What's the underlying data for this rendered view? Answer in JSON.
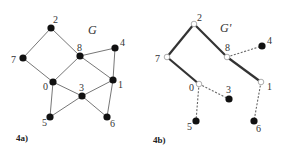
{
  "figure": {
    "panels": [
      {
        "id": "4a",
        "panel_label": "4a)",
        "graph_title": "G",
        "title_pos": [
          88,
          34
        ],
        "label_pos": [
          16,
          141
        ],
        "nodes": [
          {
            "id": "0",
            "x": 53,
            "y": 82,
            "style": "filled",
            "lx": -10,
            "ly": 8
          },
          {
            "id": "1",
            "x": 113,
            "y": 80,
            "style": "filled",
            "lx": 5,
            "ly": 8
          },
          {
            "id": "2",
            "x": 51,
            "y": 28,
            "style": "filled",
            "lx": 2,
            "ly": -5
          },
          {
            "id": "3",
            "x": 82,
            "y": 96,
            "style": "filled",
            "lx": -3,
            "ly": -5
          },
          {
            "id": "4",
            "x": 115,
            "y": 48,
            "style": "filled",
            "lx": 5,
            "ly": -2
          },
          {
            "id": "5",
            "x": 50,
            "y": 117,
            "style": "filled",
            "lx": -8,
            "ly": 9
          },
          {
            "id": "6",
            "x": 107,
            "y": 117,
            "style": "filled",
            "lx": 3,
            "ly": 10
          },
          {
            "id": "7",
            "x": 23,
            "y": 58,
            "style": "filled",
            "lx": -12,
            "ly": 5
          },
          {
            "id": "8",
            "x": 80,
            "y": 56,
            "style": "filled",
            "lx": -3,
            "ly": -5
          }
        ],
        "edges": [
          {
            "from": "2",
            "to": "7",
            "style": "thin"
          },
          {
            "from": "2",
            "to": "8",
            "style": "thin"
          },
          {
            "from": "7",
            "to": "0",
            "style": "thin"
          },
          {
            "from": "8",
            "to": "0",
            "style": "thin"
          },
          {
            "from": "8",
            "to": "4",
            "style": "thin"
          },
          {
            "from": "8",
            "to": "1",
            "style": "thin"
          },
          {
            "from": "4",
            "to": "1",
            "style": "thin"
          },
          {
            "from": "0",
            "to": "3",
            "style": "thin"
          },
          {
            "from": "0",
            "to": "5",
            "style": "thin"
          },
          {
            "from": "3",
            "to": "1",
            "style": "thin"
          },
          {
            "from": "3",
            "to": "5",
            "style": "thin"
          },
          {
            "from": "3",
            "to": "6",
            "style": "thin"
          },
          {
            "from": "1",
            "to": "6",
            "style": "thin"
          }
        ]
      },
      {
        "id": "4b",
        "panel_label": "4b)",
        "graph_title": "G'",
        "title_pos": [
          220,
          32
        ],
        "label_pos": [
          153,
          143
        ],
        "nodes": [
          {
            "id": "0",
            "x": 199,
            "y": 84,
            "style": "open",
            "lx": -10,
            "ly": 7
          },
          {
            "id": "1",
            "x": 261,
            "y": 82,
            "style": "open",
            "lx": 6,
            "ly": 8
          },
          {
            "id": "2",
            "x": 194,
            "y": 24,
            "style": "open",
            "lx": 3,
            "ly": -3
          },
          {
            "id": "3",
            "x": 229,
            "y": 99,
            "style": "filled",
            "lx": -3,
            "ly": -6
          },
          {
            "id": "4",
            "x": 262,
            "y": 46,
            "style": "filled",
            "lx": 5,
            "ly": -2
          },
          {
            "id": "5",
            "x": 196,
            "y": 121,
            "style": "filled",
            "lx": -9,
            "ly": 9
          },
          {
            "id": "6",
            "x": 254,
            "y": 121,
            "style": "filled",
            "lx": 2,
            "ly": 11
          },
          {
            "id": "7",
            "x": 167,
            "y": 57,
            "style": "open",
            "lx": -12,
            "ly": 5
          },
          {
            "id": "8",
            "x": 227,
            "y": 57,
            "style": "open",
            "lx": -2,
            "ly": -6
          }
        ],
        "edges": [
          {
            "from": "2",
            "to": "7",
            "style": "bold"
          },
          {
            "from": "2",
            "to": "8",
            "style": "bold"
          },
          {
            "from": "7",
            "to": "0",
            "style": "bold"
          },
          {
            "from": "8",
            "to": "1",
            "style": "bold"
          },
          {
            "from": "8",
            "to": "4",
            "style": "dashed"
          },
          {
            "from": "0",
            "to": "3",
            "style": "dashed"
          },
          {
            "from": "0",
            "to": "5",
            "style": "dashed"
          },
          {
            "from": "1",
            "to": "6",
            "style": "dashed"
          }
        ]
      }
    ],
    "colors": {
      "node_fill": "#111111",
      "thin_edge": "#777777",
      "bold_edge": "#333333",
      "dashed_edge": "#666666",
      "open_node_stroke": "#999999"
    }
  }
}
